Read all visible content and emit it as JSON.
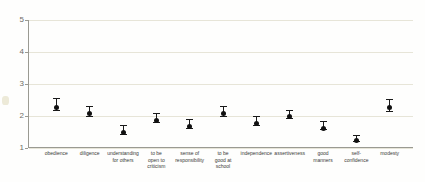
{
  "chart_data": {
    "type": "scatter",
    "title": "",
    "subtitle": "",
    "xlabel": "",
    "ylabel": "",
    "ylim": [
      1,
      5
    ],
    "yticks": [
      1,
      2,
      3,
      4,
      5
    ],
    "ytick_labels": [
      "1",
      "2",
      "3",
      "4",
      "5"
    ],
    "grid": true,
    "legend": "none",
    "error_bars": "vertical with caps",
    "categories": [
      "obedience",
      "diligence",
      "understanding\nfor others",
      "to be\nopen to\ncriticism",
      "sense of\nresponsibility",
      "to be\ngood at\nschool",
      "independence",
      "assertiveness",
      "good\nmanners",
      "self-\nconfidence",
      "modesty"
    ],
    "values": [
      2.35,
      2.15,
      1.57,
      1.93,
      1.75,
      2.15,
      1.85,
      2.07,
      1.7,
      1.3,
      2.33
    ],
    "err_low": [
      2.18,
      2.0,
      1.45,
      1.8,
      1.62,
      2.0,
      1.72,
      1.95,
      1.58,
      1.22,
      2.16
    ],
    "err_high": [
      2.55,
      2.32,
      1.72,
      2.08,
      1.9,
      2.32,
      1.99,
      2.2,
      1.83,
      1.4,
      2.52
    ],
    "marker_color": "#111111",
    "gridline_color": "#e7e5d8",
    "axis_color": "#9a9a92"
  }
}
